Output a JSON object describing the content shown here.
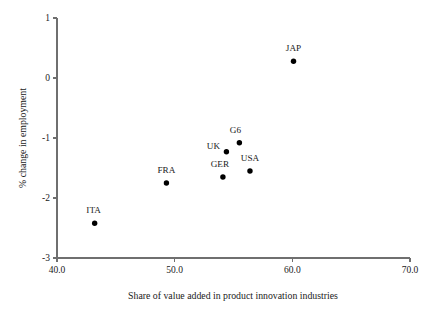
{
  "chart_data": {
    "type": "scatter",
    "title": "",
    "xlabel": "Share of value added in product innovation industries",
    "ylabel": "% change in employment",
    "xlim": [
      40.0,
      70.0
    ],
    "ylim": [
      -3,
      1
    ],
    "grid": false,
    "legend": "none",
    "xticks": [
      "40.0",
      "50.0",
      "60.0",
      "70.0"
    ],
    "xtick_values": [
      40.0,
      50.0,
      60.0,
      70.0
    ],
    "yticks": [
      "1",
      "0",
      "-1",
      "-2",
      "-3"
    ],
    "ytick_values": [
      1,
      0,
      -1,
      -2,
      -3
    ],
    "points": [
      {
        "label": "ITA",
        "x": 43.2,
        "y": -2.42,
        "label_dx": -1,
        "label_dy": -10
      },
      {
        "label": "FRA",
        "x": 49.3,
        "y": -1.75,
        "label_dx": 0,
        "label_dy": -10
      },
      {
        "label": "GER",
        "x": 54.1,
        "y": -1.65,
        "label_dx": -3,
        "label_dy": -10
      },
      {
        "label": "UK",
        "x": 54.4,
        "y": -1.23,
        "label_dx": -13,
        "label_dy": -3
      },
      {
        "label": "G6",
        "x": 55.5,
        "y": -1.08,
        "label_dx": -4,
        "label_dy": -10
      },
      {
        "label": "USA",
        "x": 56.4,
        "y": -1.55,
        "label_dx": 0,
        "label_dy": -10
      },
      {
        "label": "JAP",
        "x": 60.1,
        "y": 0.28,
        "label_dx": 0,
        "label_dy": -10
      }
    ]
  },
  "axes": {
    "x_label_text": "Share of value added in product innovation industries",
    "y_label_text": "% change in employment"
  }
}
